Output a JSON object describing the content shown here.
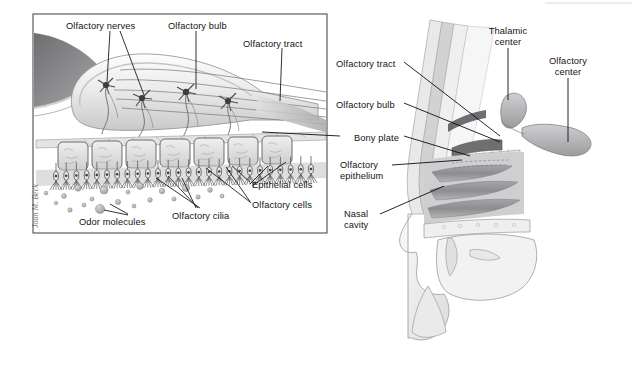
{
  "figure": {
    "background_color": "#ffffff",
    "inset_panel": {
      "name": "olfactory epithelium detail inset",
      "border_color": "#4d4d4d",
      "x": 33,
      "y": 14,
      "width": 294,
      "height": 219
    },
    "artist_signature": "Joan M. Beck"
  },
  "inset_labels": [
    {
      "text": "Olfactory nerves",
      "x": 66,
      "y": 21,
      "align": "left"
    },
    {
      "text": "Olfactory bulb",
      "x": 168,
      "y": 21,
      "align": "left"
    },
    {
      "text": "Olfactory tract",
      "x": 243,
      "y": 39,
      "align": "left"
    },
    {
      "text": "Epithelial cells",
      "x": 252,
      "y": 180,
      "align": "left"
    },
    {
      "text": "Olfactory cells",
      "x": 252,
      "y": 200,
      "align": "left"
    },
    {
      "text": "Olfactory cilia",
      "x": 172,
      "y": 211,
      "align": "left"
    },
    {
      "text": "Odor molecules",
      "x": 79,
      "y": 217,
      "align": "left"
    }
  ],
  "head_labels": [
    {
      "text": "Olfactory tract",
      "x": 336,
      "y": 59,
      "align": "left",
      "lines": 1
    },
    {
      "text": "Olfactory bulb",
      "x": 336,
      "y": 100,
      "align": "left",
      "lines": 1
    },
    {
      "text": "Bony plate",
      "x": 354,
      "y": 133,
      "align": "left",
      "lines": 1
    },
    {
      "text": "Olfactory\nepithelium",
      "x": 340,
      "y": 160,
      "align": "left",
      "lines": 2
    },
    {
      "text": "Nasal\ncavity",
      "x": 344,
      "y": 209,
      "align": "left",
      "lines": 2
    },
    {
      "text": "Thalamic\ncenter",
      "x": 508,
      "y": 26,
      "align": "center",
      "lines": 2
    },
    {
      "text": "Olfactory\ncenter",
      "x": 568,
      "y": 56,
      "align": "center",
      "lines": 2
    }
  ],
  "structures": {
    "olfactory_bulb": "pale oval body of the bulb with mitral neurons",
    "mitral_cells": 4,
    "epithelial_cells_row": "row of columnar supporting cells",
    "olfactory_cilia": "hair-like cilia projecting into the mucus",
    "odor_molecules": "scattered round particles in nasal air",
    "olfactory_tract": "parallel nerve fibers leaving the bulb",
    "nasal_turbinates": "three shelf-like folds in the nasal cavity",
    "thalamic_center": "lobed gray structure in the brain",
    "olfactory_center": "lobed gray cortical structure"
  },
  "colors": {
    "ink": "#141414",
    "leader": "#0f0f0f",
    "panel_border": "#4d4d4d",
    "tissue_light": "#e8e8e8",
    "tissue_mid": "#b9b9b9",
    "tissue_dark": "#7d7d7d",
    "tissue_darkest": "#58585a"
  }
}
